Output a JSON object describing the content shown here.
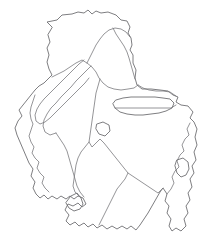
{
  "figure": {
    "type": "map-outline",
    "title": "",
    "width": 208,
    "height": 241,
    "background_color": "#ffffff",
    "stroke_color": "#6f6f73",
    "stroke_width": 0.9,
    "fill": "none"
  },
  "shapes": {
    "outer_boundary": {
      "name": "outer-boundary",
      "path": "M 52 27 L 47 22 L 57 20 L 62 15 L 72 14 L 78 12 L 84 13 L 88 10 L 92 14 L 96 11 L 101 13 L 108 12 L 116 15 L 121 20 L 127 21 L 130 27 L 128 33 L 131 38 L 132 45 L 130 50 L 133 55 L 133 63 L 136 70 L 135 78 L 137 85 L 142 89 L 151 89 L 160 90 L 168 91 L 173 95 L 178 97 L 176 102 L 181 105 L 188 106 L 193 112 L 190 118 L 194 122 L 197 129 L 195 137 L 197 145 L 194 152 L 196 160 L 192 166 L 194 173 L 190 179 L 192 187 L 188 193 L 190 200 L 186 206 L 188 213 L 184 219 L 186 226 L 181 231 L 176 228 L 172 231 L 169 226 L 171 219 L 167 213 L 169 206 L 165 201 L 167 194 L 163 188 L 160 192 L 156 199 L 152 206 L 148 213 L 144 219 L 140 225 L 136 230 L 131 226 L 127 229 L 122 226 L 117 229 L 112 226 L 107 229 L 102 225 L 97 228 L 93 224 L 88 227 L 84 223 L 79 226 L 75 222 L 70 225 L 66 221 L 69 215 L 65 210 L 68 204 L 73 206 L 78 203 L 82 207 L 86 204 L 83 198 L 78 196 L 74 199 L 70 196 L 66 199 L 61 196 L 57 199 L 52 196 L 48 199 L 44 195 L 40 198 L 36 194 L 33 188 L 35 182 L 31 176 L 33 169 L 29 163 L 26 156 L 23 149 L 20 142 L 17 135 L 15 128 L 18 121 L 22 116 L 19 110 L 23 105 L 27 100 L 31 95 L 35 90 L 39 86 L 44 83 L 48 79 L 52 75 L 49 69 L 47 62 L 49 55 L 47 48 L 50 42 L 48 35 Z",
      "interactable": false
    },
    "internal_boundaries": [
      {
        "name": "northern-district-divider",
        "path": "M 52 77 L 58 74 L 64 71 L 70 67 L 76 63 L 82 60 L 87 63 L 92 67 L 96 72 L 99 78 L 103 83 L 108 87 L 114 89 L 121 90 L 128 89 L 134 88 L 138 85",
        "interactable": false
      },
      {
        "name": "central-ridge-boundary",
        "path": "M 87 63 L 90 57 L 93 51 L 96 45 L 100 39 L 104 34 L 109 30 L 115 28 L 121 29 L 126 32 L 130 37",
        "interactable": false
      },
      {
        "name": "northeast-panhandle-edge",
        "path": "M 113 28 L 116 34 L 120 40 L 124 46 L 127 52 L 129 58 L 131 65 L 133 72 L 135 79",
        "interactable": false
      },
      {
        "name": "diagonal-corridor-left",
        "path": "M 84 60 L 79 64 L 74 69 L 69 74 L 64 79 L 59 84 L 54 89 L 49 94 L 44 99 L 40 104 L 37 109 L 35 115 L 36 121 L 40 124 L 45 122 L 50 118 L 55 113 L 60 108 L 65 103 L 70 98 L 75 93 L 80 88 L 85 83 L 89 78",
        "interactable": false
      },
      {
        "name": "diagonal-corridor-right",
        "path": "M 91 66 L 86 71 L 81 76 L 76 81 L 71 87 L 66 92 L 61 97 L 56 103 L 51 108 L 47 114 L 44 120 L 43 126 L 45 132 L 50 135 L 56 133",
        "interactable": false
      },
      {
        "name": "west-coastal-inner-line",
        "path": "M 35 95 L 33 101 L 31 107 L 30 113 L 31 119 L 33 124 L 31 130 L 29 136 L 31 142 L 34 147 L 32 153 L 35 158 L 39 162 L 37 168 L 40 173 L 44 177 L 42 183 L 45 188 L 49 192",
        "interactable": false
      },
      {
        "name": "southwest-valley-boundary",
        "path": "M 56 133 L 60 139 L 64 145 L 67 151 L 69 158 L 71 165 L 73 172 L 75 179 L 77 186 L 80 192 L 84 197",
        "interactable": false
      },
      {
        "name": "central-basin-boundary",
        "path": "M 100 79 L 98 86 L 96 93 L 95 100 L 94 107 L 93 114 L 92 121 L 91 128 L 90 135 L 89 142 L 92 147 L 96 143 L 100 139 L 104 143 L 108 148 L 112 153 L 116 158 L 120 163 L 124 168 L 128 173 L 125 179 L 121 184 L 117 189 L 114 195 L 111 201 L 108 207 L 105 213 L 102 219 L 99 225",
        "interactable": false
      },
      {
        "name": "southeast-plain-boundary",
        "path": "M 89 142 L 85 147 L 81 152 L 78 158 L 76 165 L 75 172 L 74 179 L 73 186 L 75 192 L 79 196",
        "interactable": false
      },
      {
        "name": "eastern-divider",
        "path": "M 128 173 L 134 177 L 140 181 L 146 185 L 152 189 L 158 193 L 163 188",
        "interactable": false
      },
      {
        "name": "east-upper-divider",
        "path": "M 138 85 L 143 88 L 149 90 L 156 91 L 163 91 L 170 92 L 176 96",
        "interactable": false
      },
      {
        "name": "east-lower-divider",
        "path": "M 115 108 L 122 108 L 129 108 L 136 108 L 143 108 L 150 108 L 157 108 L 164 108 L 171 108 L 176 105",
        "interactable": false
      },
      {
        "name": "southeast-coast-inner",
        "path": "M 167 194 L 171 189 L 174 183 L 172 177 L 175 171 L 179 167 L 177 161 L 180 155 L 184 151 L 182 145 L 185 139 L 189 135 L 187 129 L 190 123",
        "interactable": false
      }
    ],
    "enclaves": [
      {
        "name": "horizontal-enclave-east",
        "path": "M 116 100 L 123 98 L 131 97 L 139 97 L 147 97 L 155 97 L 163 98 L 170 99 L 174 103 L 172 108 L 166 111 L 159 113 L 151 114 L 143 115 L 135 115 L 127 114 L 120 112 L 115 108 L 113 104 Z",
        "interactable": false
      },
      {
        "name": "small-pentagon-enclave-center",
        "path": "M 97 124 L 103 122 L 109 125 L 110 131 L 105 136 L 99 134 L 96 129 Z",
        "interactable": false
      },
      {
        "name": "southern-arrow-enclave",
        "path": "M 71 196 L 77 193 L 81 198 L 83 204 L 80 209 L 74 211 L 69 208 L 66 203 Z",
        "interactable": false
      },
      {
        "name": "east-bulge-enclave",
        "path": "M 177 160 L 183 158 L 188 162 L 189 169 L 186 175 L 181 177 L 177 173 L 175 166 Z",
        "interactable": false
      }
    ]
  }
}
